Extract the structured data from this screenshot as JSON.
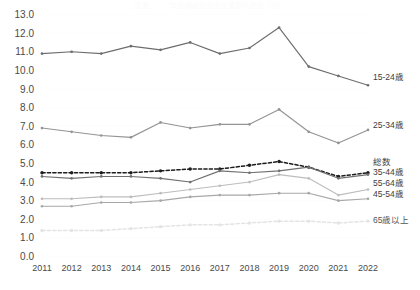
{
  "chart_data": {
    "type": "line",
    "title": "図表　　　年齢階級別完全失業率の推移（％）",
    "xlabel": "",
    "ylabel": "",
    "categories": [
      "2011",
      "2012",
      "2013",
      "2014",
      "2015",
      "2016",
      "2017",
      "2018",
      "2019",
      "2020",
      "2021",
      "2022"
    ],
    "ylim": [
      0.0,
      13.0
    ],
    "ytick_step": 1.0,
    "ytick_labels": [
      "0.0",
      "1.0",
      "2.0",
      "3.0",
      "4.0",
      "5.0",
      "6.0",
      "7.0",
      "8.0",
      "9.0",
      "10.0",
      "11.0",
      "12.0",
      "13.0"
    ],
    "grid": true,
    "legend_position": "right-inline",
    "series": [
      {
        "name": "15-24歳",
        "color": "#6e6e6e",
        "style": "solid",
        "label_y_value": 9.6,
        "values": [
          10.9,
          11.0,
          10.9,
          11.3,
          11.1,
          11.5,
          10.9,
          11.2,
          12.3,
          10.2,
          9.7,
          9.2
        ]
      },
      {
        "name": "25-34歳",
        "color": "#949494",
        "style": "solid",
        "label_y_value": 7.0,
        "values": [
          6.9,
          6.7,
          6.5,
          6.4,
          7.2,
          6.9,
          7.1,
          7.1,
          7.9,
          6.7,
          6.1,
          6.8
        ]
      },
      {
        "name": "総数",
        "color": "#1c1c1c",
        "style": "dashed",
        "label_y_value": 5.0,
        "values": [
          4.5,
          4.5,
          4.5,
          4.5,
          4.6,
          4.7,
          4.7,
          4.9,
          5.1,
          4.8,
          4.3,
          4.5
        ]
      },
      {
        "name": "35-44歳",
        "color": "#707070",
        "style": "solid",
        "label_y_value": 4.5,
        "values": [
          4.3,
          4.2,
          4.3,
          4.3,
          4.2,
          4.0,
          4.6,
          4.5,
          4.6,
          4.8,
          4.2,
          4.4
        ]
      },
      {
        "name": "55-64歳",
        "color": "#bdbdbd",
        "style": "solid",
        "label_y_value": 3.9,
        "values": [
          3.1,
          3.1,
          3.2,
          3.2,
          3.4,
          3.6,
          3.8,
          4.0,
          4.4,
          4.2,
          3.3,
          3.6
        ]
      },
      {
        "name": "45-54歳",
        "color": "#a8a8a8",
        "style": "solid",
        "label_y_value": 3.3,
        "values": [
          2.7,
          2.7,
          2.9,
          2.9,
          3.0,
          3.2,
          3.3,
          3.3,
          3.4,
          3.4,
          3.0,
          3.1
        ]
      },
      {
        "name": "65歳以上",
        "color": "#e4e4e4",
        "style": "dashed",
        "label_y_value": 1.9,
        "values": [
          1.4,
          1.4,
          1.4,
          1.5,
          1.6,
          1.7,
          1.7,
          1.8,
          1.9,
          1.9,
          1.8,
          1.9
        ]
      }
    ]
  },
  "legend": {
    "items": [
      {
        "label": "15-24歳"
      },
      {
        "label": "25-34歳"
      },
      {
        "label": "総数"
      },
      {
        "label": "35-44歳"
      },
      {
        "label": "55-64歳"
      },
      {
        "label": "45-54歳"
      },
      {
        "label": "65歳以上"
      }
    ]
  }
}
